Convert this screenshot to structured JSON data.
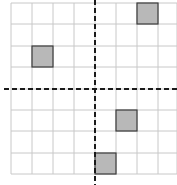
{
  "diagram": {
    "type": "coordinate-grid",
    "columns": 8,
    "rows": 8,
    "colors": {
      "background": "#ffffff",
      "grid_line": "#c8c8c8",
      "axis": "#1a1a1a",
      "shaded_fill": "#b8b8b8",
      "shaded_stroke": "#3a3a3a"
    },
    "grid_x": [
      11,
      32,
      53,
      74,
      95,
      116,
      137,
      158,
      177
    ],
    "grid_y": [
      3,
      24,
      46,
      67,
      89,
      110,
      131,
      153,
      174
    ],
    "axes": {
      "vertical_x": 95,
      "horizontal_y": 89
    },
    "shaded_cells": [
      {
        "col": 6,
        "row": 0
      },
      {
        "col": 1,
        "row": 2
      },
      {
        "col": 5,
        "row": 5
      },
      {
        "col": 4,
        "row": 7
      }
    ]
  }
}
